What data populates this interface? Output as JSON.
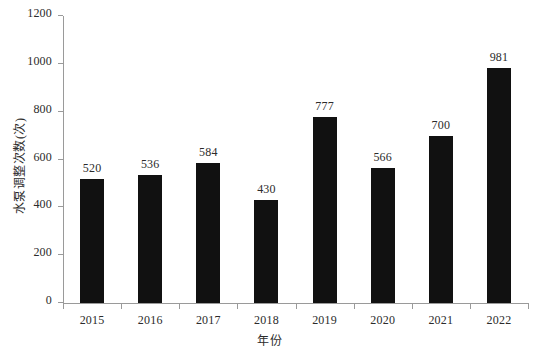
{
  "chart_data": {
    "type": "bar",
    "title": "",
    "xlabel": "年份",
    "ylabel": "水泵调整次数(次)",
    "categories": [
      "2015",
      "2016",
      "2017",
      "2018",
      "2019",
      "2020",
      "2021",
      "2022"
    ],
    "values": [
      520,
      536,
      584,
      430,
      777,
      566,
      700,
      981
    ],
    "value_labels": [
      "520",
      "536",
      "584",
      "430",
      "777",
      "566",
      "700",
      "981"
    ],
    "ylim": [
      0,
      1200
    ],
    "yticks": [
      0,
      200,
      400,
      600,
      800,
      1000,
      1200
    ],
    "ytick_labels": [
      "0",
      "200",
      "400",
      "600",
      "800",
      "1000",
      "1200"
    ],
    "grid": false,
    "legend": null,
    "bar_color": "#111111",
    "axis_color": "#9a9a9a",
    "background": "#ffffff"
  }
}
